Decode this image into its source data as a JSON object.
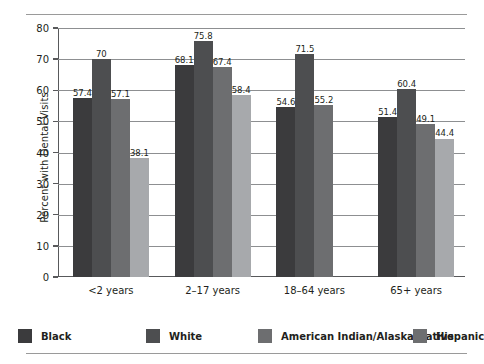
{
  "chart_data": {
    "type": "bar",
    "title": "",
    "subtitle": "",
    "xlabel": "",
    "ylabel": "Percent with Dental Visits",
    "ylim": [
      0,
      80
    ],
    "ytick_step": 10,
    "yticks": [
      "0",
      "10",
      "20",
      "30",
      "40",
      "50",
      "60",
      "70",
      "80"
    ],
    "grid": true,
    "legend_position": "bottom",
    "categories": [
      "<2 years",
      "2–17 years",
      "18–64 years",
      "65+ years"
    ],
    "series": [
      {
        "name": "Black",
        "color": "#3b3b3d",
        "values": [
          57.4,
          68.1,
          54.6,
          51.4
        ],
        "labels": [
          "57.4",
          "68.1",
          "54.6",
          "51.4"
        ]
      },
      {
        "name": "White",
        "color": "#4d4e50",
        "values": [
          70,
          75.8,
          71.5,
          60.4
        ],
        "labels": [
          "70",
          "75.8",
          "71.5",
          "60.4"
        ]
      },
      {
        "name": "American Indian/Alaska Native",
        "color": "#6d6e70",
        "values": [
          57.1,
          67.4,
          55.2,
          49.1
        ],
        "labels": [
          "57.1",
          "67.4",
          "55.2",
          "49.1"
        ]
      },
      {
        "name": "Hispanic",
        "color": "#a7a9ac",
        "values": [
          38.1,
          58.4,
          null,
          44.4
        ],
        "labels": [
          "38.1",
          "58.4",
          "",
          "44.4"
        ]
      }
    ]
  },
  "legend": {
    "items": [
      {
        "label": "Black",
        "color": "#3b3b3d"
      },
      {
        "label": "White",
        "color": "#4d4e50"
      },
      {
        "label": "American Indian/Alaska Native",
        "color": "#6d6e70"
      },
      {
        "label": "Hispanic",
        "color": "#6d6e70"
      }
    ]
  },
  "rules": {
    "top_divider": "",
    "bottom_divider": ""
  }
}
